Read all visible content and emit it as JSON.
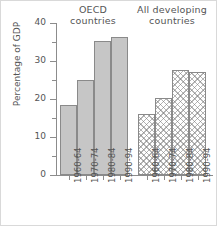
{
  "chart_data": {
    "type": "bar",
    "title": "",
    "xlabel": "",
    "ylabel": "Percentage of GDP",
    "ylim": [
      0,
      40
    ],
    "yticks": [
      0,
      10,
      20,
      30,
      40
    ],
    "ytick_labels": [
      "0",
      "10",
      "20",
      "30",
      "40"
    ],
    "minor_yticks": [
      5,
      15,
      25,
      35
    ],
    "grid": false,
    "legend": "none",
    "categories": [
      "1960-64",
      "1970-74",
      "1980-84",
      "1990-94"
    ],
    "groups": [
      {
        "name": "OECD countries",
        "title_line1": "OECD",
        "title_line2": "countries",
        "fill": "solid-gray",
        "color": "#c6c6c6",
        "categories": [
          "1960-64",
          "1970-74",
          "1980-84",
          "1990-94"
        ],
        "values": [
          18.5,
          25.0,
          35.2,
          36.4
        ]
      },
      {
        "name": "All developing countries",
        "title_line1": "All developing",
        "title_line2": "countries",
        "fill": "crosshatch",
        "color": "#ffffff",
        "categories": [
          "1960-64",
          "1970-74",
          "1980-84",
          "1990-94"
        ],
        "values": [
          16.0,
          20.2,
          27.6,
          27.0
        ]
      }
    ]
  },
  "axes": {
    "y_axis_title": "Percentage of GDP",
    "y_tick_0": "0",
    "y_tick_10": "10",
    "y_tick_20": "20",
    "y_tick_30": "30",
    "y_tick_40": "40"
  },
  "titles": {
    "oecd_line1": "OECD",
    "oecd_line2": "countries",
    "dev_line1": "All developing",
    "dev_line2": "countries"
  },
  "xlabels": {
    "oecd": [
      "1960-64",
      "1970-74",
      "1980-84",
      "1990-94"
    ],
    "dev": [
      "1960-64",
      "1970-74",
      "1980-84",
      "1990-94"
    ]
  },
  "colors": {
    "bar_solid": "#c6c6c6",
    "bar_outline": "#8a8a8a",
    "axis": "#8c8c8c",
    "text": "#555555"
  }
}
